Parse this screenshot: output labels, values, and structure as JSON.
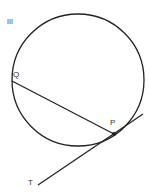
{
  "figure_label": "III",
  "points": {
    "Q": "Q",
    "P": "P",
    "T": "T"
  },
  "colors": {
    "stroke": "#222222"
  }
}
